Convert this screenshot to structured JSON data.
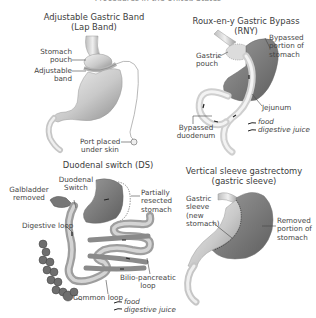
{
  "header": {
    "title": "Procedures in the United States"
  },
  "panels": {
    "lap_band": {
      "title_line1": "Adjustable Gastric Band",
      "title_line2": "(Lap Band)",
      "labels": {
        "stomach_pouch_1": "Stomach",
        "stomach_pouch_2": "pouch",
        "band_1": "Adjustable",
        "band_2": "band",
        "port_1": "Port placed",
        "port_2": "under skin"
      }
    },
    "rny": {
      "title_line1": "Roux-en-y Gastric Bypass",
      "title_line2": "(RNY)",
      "labels": {
        "pouch_1": "Gastric",
        "pouch_2": "pouch",
        "bypassed_stomach_1": "Bypassed",
        "bypassed_stomach_2": "portion of",
        "bypassed_stomach_3": "stomach",
        "jejunum": "Jejunum",
        "duodenum_1": "Bypassed",
        "duodenum_2": "duodenum"
      },
      "legend": {
        "food": "food",
        "juice": "digestive juice"
      }
    },
    "ds": {
      "title": "Duodenal switch (DS)",
      "labels": {
        "gallbladder_1": "Galbladder",
        "gallbladder_2": "removed",
        "switch_1": "Duodenal",
        "switch_2": "Switch",
        "resected_1": "Partially",
        "resected_2": "resected",
        "resected_3": "stomach",
        "digestive_loop": "Digestive loop",
        "bilio_1": "Bilio-pancreatic",
        "bilio_2": "loop",
        "common_loop": "Common loop"
      },
      "legend": {
        "food": "food",
        "juice": "digestive juice"
      }
    },
    "sleeve": {
      "title_line1": "Vertical sleeve gastrectomy",
      "title_line2": "(gastric sleeve)",
      "labels": {
        "sleeve_1": "Gastric",
        "sleeve_2": "sleeve",
        "sleeve_3": "(new",
        "sleeve_4": "stomach)",
        "removed_1": "Removed",
        "removed_2": "portion of",
        "removed_3": "stomach"
      }
    }
  },
  "colors": {
    "stomach_light": "#d9d9d9",
    "stomach_dark": "#8e8e8e",
    "intestine": "#a8a8a8",
    "colon": "#6f6f6f",
    "line": "#3a3a3a"
  }
}
